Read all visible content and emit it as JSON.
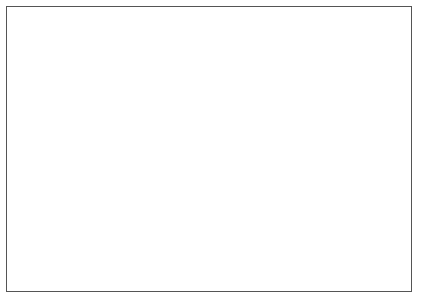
{
  "chart_data": {
    "type": "line",
    "title": "",
    "xlabel": "",
    "ylabel": "# per 1000",
    "y2label": "%",
    "ylim": [
      0,
      70
    ],
    "y2lim": [
      0,
      10
    ],
    "grid": false,
    "legend_position": "inline-right",
    "x": [
      1957,
      1958,
      1959,
      1960,
      1961,
      1962,
      1963,
      1964,
      1965,
      1966,
      1967,
      1968,
      1969,
      1970,
      1971,
      1972,
      1973,
      1974,
      1975,
      1976,
      1977,
      1978,
      1979,
      1980,
      1981,
      1982,
      1983,
      1984,
      1985,
      1986,
      1987,
      1988,
      1989,
      1990
    ],
    "xtick_labels": [
      "1957",
      "1960",
      "1963",
      "1966",
      "1969",
      "1972",
      "1975",
      "1978",
      "1981",
      "1984",
      "1987",
      "1990"
    ],
    "xtick_years": [
      1957,
      1960,
      1963,
      1966,
      1969,
      1972,
      1975,
      1978,
      1981,
      1984,
      1987,
      1990
    ],
    "ytick_labels": [
      "0",
      "10",
      "20",
      "30",
      "40",
      "50",
      "60",
      "70"
    ],
    "ytick_values": [
      0,
      10,
      20,
      30,
      40,
      50,
      60,
      70
    ],
    "y2tick_labels": [
      "0",
      "1",
      "2",
      "3",
      "4",
      "5",
      "6",
      "7",
      "8",
      "9",
      "10"
    ],
    "y2tick_values": [
      0,
      1,
      2,
      3,
      4,
      5,
      6,
      7,
      8,
      9,
      10
    ],
    "series": [
      {
        "name": "Birth rate",
        "style": "solid",
        "label_x": 1984,
        "label_y": 56,
        "values": [
          38.0,
          35.0,
          40.0,
          37.0,
          43.5,
          41.0,
          45.5,
          48.5,
          42.0,
          51.5,
          52.0,
          55.0,
          46.0,
          45.5,
          57.0,
          58.5,
          62.0,
          63.0,
          61.0,
          58.5,
          56.5,
          58.0,
          52.0,
          56.5,
          52.0,
          51.5,
          53.0,
          54.5,
          54.0,
          53.5,
          53.0,
          54.0,
          53.5,
          53.0
        ]
      },
      {
        "name": "Natural increase rate",
        "style": "dotted",
        "label_x": 1984,
        "label_y": 38.5,
        "values": [
          22.0,
          24.5,
          25.0,
          21.5,
          25.0,
          24.5,
          26.0,
          28.0,
          24.0,
          27.5,
          30.0,
          31.0,
          28.5,
          29.0,
          34.0,
          36.5,
          37.5,
          38.0,
          36.0,
          33.5,
          31.5,
          34.0,
          29.0,
          31.5,
          33.0,
          33.5,
          34.0,
          35.5,
          35.0,
          34.5,
          34.5,
          35.0,
          35.0,
          35.0
        ]
      },
      {
        "name": "Death rate",
        "style": "dashed",
        "label_x": 1988,
        "label_y": 9.5,
        "values": [
          6.2,
          5.3,
          5.3,
          7.5,
          6.0,
          5.5,
          5.5,
          5.5,
          5.6,
          5.6,
          5.5,
          5.5,
          5.6,
          5.7,
          5.6,
          5.6,
          5.6,
          5.7,
          5.8,
          6.0,
          6.2,
          5.8,
          5.2,
          4.9,
          4.9,
          4.8,
          4.8,
          4.8,
          4.8,
          4.8,
          4.7,
          4.7,
          4.7,
          4.7
        ]
      }
    ]
  }
}
